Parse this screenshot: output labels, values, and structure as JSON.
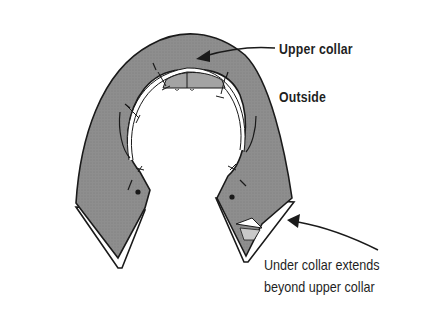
{
  "figure": {
    "labels": {
      "upper_collar": "Upper collar",
      "outside": "Outside",
      "under_collar_line1": "Under collar extends",
      "under_collar_line2": "beyond upper collar"
    },
    "footer_text": "",
    "colors": {
      "collar_fill": "#8e8e8e",
      "outline": "#1a1a1a",
      "under_collar_fill": "#ffffff",
      "background": "#ffffff",
      "text": "#1f1f1f"
    }
  }
}
